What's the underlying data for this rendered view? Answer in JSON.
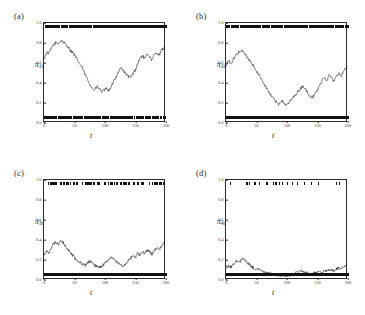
{
  "figure": {
    "background": "#ffffff",
    "line_color": "#1a1a1a",
    "rug_color": "#111111",
    "axis_color": "#2b2b2b"
  },
  "axes": {
    "xlabel": "t",
    "xticks": [
      "0",
      "50",
      "100",
      "150",
      "200"
    ],
    "xtick_values": [
      0,
      50,
      100,
      150,
      200
    ],
    "xlim": [
      0,
      200
    ],
    "yticks": [
      "0.0",
      "0.2",
      "0.4",
      "0.6",
      "0.8",
      "1.0"
    ],
    "ytick_values": [
      0.0,
      0.2,
      0.4,
      0.6,
      0.8,
      1.0
    ],
    "ylim": [
      0.0,
      1.0
    ]
  },
  "panels": [
    {
      "label": "(a)",
      "ylabel_base": "π",
      "ylabel_sub": "1t",
      "name": "panel-a"
    },
    {
      "label": "(b)",
      "ylabel_base": "π",
      "ylabel_sub": "2t",
      "name": "panel-b"
    },
    {
      "label": "(c)",
      "ylabel_base": "π",
      "ylabel_sub": "3t",
      "name": "panel-c"
    },
    {
      "label": "(d)",
      "ylabel_base": "π",
      "ylabel_sub": "4t",
      "name": "panel-d"
    }
  ],
  "chart_data": {
    "type": "line",
    "title": "",
    "xlabel": "t",
    "ylabel": "",
    "xlim": [
      0,
      200
    ],
    "ylim": [
      0.0,
      1.0
    ],
    "grid": false,
    "legend": "none",
    "panels": [
      {
        "label": "(a)",
        "ylabel": "π_1t",
        "x": [
          0,
          4,
          8,
          12,
          16,
          20,
          24,
          28,
          32,
          36,
          40,
          44,
          48,
          52,
          56,
          60,
          64,
          68,
          72,
          76,
          80,
          84,
          88,
          92,
          96,
          100,
          104,
          108,
          112,
          116,
          120,
          124,
          128,
          132,
          136,
          140,
          144,
          148,
          152,
          156,
          160,
          164,
          168,
          172,
          176,
          180,
          184,
          188,
          192,
          196,
          200
        ],
        "y": [
          0.63,
          0.7,
          0.69,
          0.74,
          0.78,
          0.8,
          0.79,
          0.82,
          0.81,
          0.78,
          0.76,
          0.72,
          0.7,
          0.66,
          0.62,
          0.58,
          0.54,
          0.48,
          0.43,
          0.38,
          0.34,
          0.31,
          0.35,
          0.33,
          0.3,
          0.31,
          0.33,
          0.31,
          0.34,
          0.41,
          0.45,
          0.5,
          0.54,
          0.52,
          0.48,
          0.46,
          0.44,
          0.48,
          0.52,
          0.58,
          0.64,
          0.67,
          0.63,
          0.69,
          0.66,
          0.62,
          0.68,
          0.7,
          0.67,
          0.72,
          0.75
        ],
        "rug_top_density": "high",
        "rug_bottom_density": "high"
      },
      {
        "label": "(b)",
        "ylabel": "π_2t",
        "x": [
          0,
          4,
          8,
          12,
          16,
          20,
          24,
          28,
          32,
          36,
          40,
          44,
          48,
          52,
          56,
          60,
          64,
          68,
          72,
          76,
          80,
          84,
          88,
          92,
          96,
          100,
          104,
          108,
          112,
          116,
          120,
          124,
          128,
          132,
          136,
          140,
          144,
          148,
          152,
          156,
          160,
          164,
          168,
          172,
          176,
          180,
          184,
          188,
          192,
          196,
          200
        ],
        "y": [
          0.56,
          0.62,
          0.58,
          0.63,
          0.67,
          0.69,
          0.72,
          0.71,
          0.68,
          0.64,
          0.61,
          0.58,
          0.54,
          0.5,
          0.46,
          0.42,
          0.37,
          0.33,
          0.29,
          0.25,
          0.22,
          0.19,
          0.17,
          0.21,
          0.19,
          0.16,
          0.18,
          0.21,
          0.24,
          0.27,
          0.3,
          0.33,
          0.36,
          0.33,
          0.29,
          0.26,
          0.24,
          0.27,
          0.31,
          0.36,
          0.42,
          0.45,
          0.41,
          0.47,
          0.44,
          0.4,
          0.46,
          0.49,
          0.45,
          0.51,
          0.55
        ],
        "rug_top_density": "high",
        "rug_bottom_density": "very-high"
      },
      {
        "label": "(c)",
        "ylabel": "π_3t",
        "x": [
          0,
          4,
          8,
          12,
          16,
          20,
          24,
          28,
          32,
          36,
          40,
          44,
          48,
          52,
          56,
          60,
          64,
          68,
          72,
          76,
          80,
          84,
          88,
          92,
          96,
          100,
          104,
          108,
          112,
          116,
          120,
          124,
          128,
          132,
          136,
          140,
          144,
          148,
          152,
          156,
          160,
          164,
          168,
          172,
          176,
          180,
          184,
          188,
          192,
          196,
          200
        ],
        "y": [
          0.24,
          0.28,
          0.26,
          0.31,
          0.35,
          0.37,
          0.34,
          0.38,
          0.36,
          0.32,
          0.29,
          0.26,
          0.23,
          0.2,
          0.18,
          0.16,
          0.14,
          0.13,
          0.15,
          0.17,
          0.16,
          0.13,
          0.12,
          0.11,
          0.12,
          0.14,
          0.17,
          0.19,
          0.21,
          0.19,
          0.17,
          0.15,
          0.13,
          0.12,
          0.14,
          0.17,
          0.2,
          0.23,
          0.21,
          0.25,
          0.23,
          0.27,
          0.25,
          0.29,
          0.27,
          0.24,
          0.28,
          0.31,
          0.29,
          0.33,
          0.36
        ],
        "rug_top_density": "medium",
        "rug_bottom_density": "solid"
      },
      {
        "label": "(d)",
        "ylabel": "π_4t",
        "x": [
          0,
          4,
          8,
          12,
          16,
          20,
          24,
          28,
          32,
          36,
          40,
          44,
          48,
          52,
          56,
          60,
          64,
          68,
          72,
          76,
          80,
          84,
          88,
          92,
          96,
          100,
          104,
          108,
          112,
          116,
          120,
          124,
          128,
          132,
          136,
          140,
          144,
          148,
          152,
          156,
          160,
          164,
          168,
          172,
          176,
          180,
          184,
          188,
          192,
          196,
          200
        ],
        "y": [
          0.1,
          0.12,
          0.11,
          0.14,
          0.16,
          0.18,
          0.17,
          0.2,
          0.18,
          0.15,
          0.13,
          0.11,
          0.1,
          0.09,
          0.08,
          0.07,
          0.06,
          0.05,
          0.05,
          0.04,
          0.04,
          0.03,
          0.03,
          0.02,
          0.02,
          0.02,
          0.03,
          0.03,
          0.04,
          0.05,
          0.06,
          0.07,
          0.06,
          0.05,
          0.05,
          0.04,
          0.04,
          0.05,
          0.06,
          0.07,
          0.06,
          0.08,
          0.07,
          0.09,
          0.08,
          0.07,
          0.09,
          0.1,
          0.09,
          0.11,
          0.13
        ],
        "rug_top_density": "sparse",
        "rug_bottom_density": "solid"
      }
    ]
  }
}
